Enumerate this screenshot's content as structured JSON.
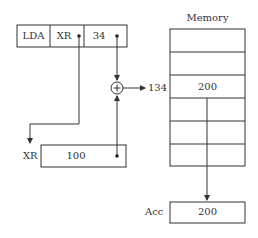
{
  "diagram": {
    "type": "indexed-addressing",
    "instruction": {
      "opcode": "LDA",
      "register": "XR",
      "offset": "34"
    },
    "index_register": {
      "label": "XR",
      "value": "100"
    },
    "adder": {
      "symbol": "+",
      "result_address": "134"
    },
    "memory": {
      "title": "Memory",
      "rows": [
        "",
        "",
        "200",
        "",
        "",
        ""
      ],
      "highlighted_row_index": 2
    },
    "accumulator": {
      "label": "Acc",
      "value": "200"
    },
    "colors": {
      "stroke": "#333333",
      "background": "#ffffff"
    }
  }
}
